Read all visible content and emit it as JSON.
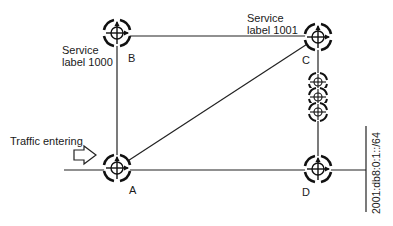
{
  "diagram": {
    "type": "network-topology",
    "routers": [
      {
        "id": "A",
        "label": "A",
        "x": 117,
        "y": 168
      },
      {
        "id": "B",
        "label": "B",
        "x": 117,
        "y": 33
      },
      {
        "id": "C",
        "label": "C",
        "x": 318,
        "y": 37
      },
      {
        "id": "D",
        "label": "D",
        "x": 318,
        "y": 169
      }
    ],
    "intermediate_routers": [
      {
        "x": 318,
        "y": 82
      },
      {
        "x": 318,
        "y": 97
      },
      {
        "x": 318,
        "y": 112
      }
    ],
    "links": [
      {
        "from": "A",
        "to": "B"
      },
      {
        "from": "B",
        "to": "C"
      },
      {
        "from": "A",
        "to": "C"
      },
      {
        "from": "C",
        "to": "D",
        "via": "intermediate_routers"
      },
      {
        "from": "A",
        "to": "D"
      }
    ],
    "labels": {
      "service_b_line1": "Service",
      "service_b_line2": "label 1000",
      "service_c_line1": "Service",
      "service_c_line2": "label 1001",
      "router_a": "A",
      "router_b": "B",
      "router_c": "C",
      "router_d": "D",
      "traffic": "Traffic entering",
      "prefix": "2001:db8:0:1::/64"
    },
    "colors": {
      "line": "#222222",
      "background": "#ffffff"
    }
  }
}
